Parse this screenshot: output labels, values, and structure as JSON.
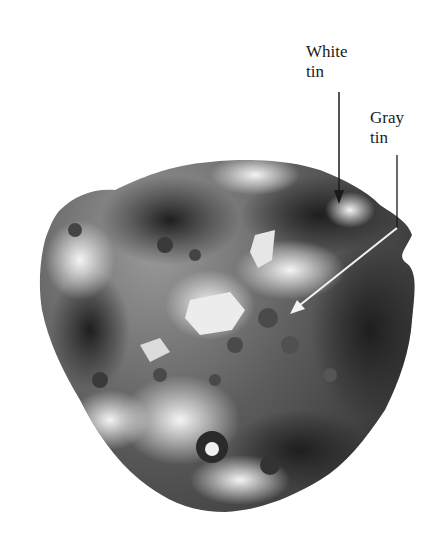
{
  "figure": {
    "labels": [
      {
        "id": "white",
        "line1": "White",
        "line2": "tin"
      },
      {
        "id": "gray",
        "line1": "Gray",
        "line2": "tin"
      }
    ],
    "colors": {
      "background": "#ffffff",
      "dark_metal": "#2a2a2a",
      "mid_metal": "#6e6e6e",
      "light_metal": "#d8d8d8",
      "arrow_black": "#1a1a1a",
      "arrow_white": "#f2f2f2"
    }
  }
}
